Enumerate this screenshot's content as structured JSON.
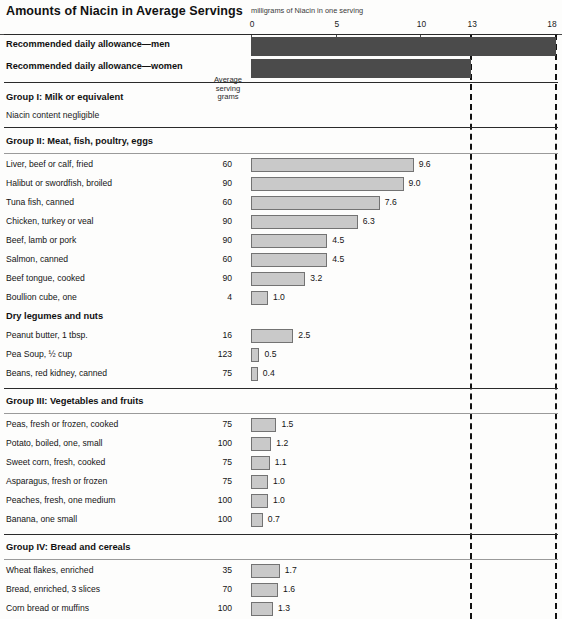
{
  "chart_data": {
    "type": "bar",
    "title": "Amounts of Niacin in Average Servings",
    "xlabel": "milligrams of Niacin in one serving",
    "ylabel": "",
    "xlim": [
      0,
      18
    ],
    "xticks": [
      0,
      5,
      10,
      13,
      18
    ],
    "xtick_labels": [
      "0",
      "5",
      "10",
      "13",
      "18"
    ],
    "grid": false,
    "legend": "none",
    "orientation": "horizontal",
    "reference_lines": [
      {
        "value": 13,
        "style": "dashed",
        "label": "Recommended daily allowance—women"
      },
      {
        "value": 18,
        "style": "dashed",
        "label": "Recommended daily allowance—men"
      }
    ],
    "series": [
      {
        "name": "Recommended daily allowance",
        "color": "#4b4b4b",
        "items": [
          {
            "label": "Recommended daily allowance—men",
            "value": 18
          },
          {
            "label": "Recommended daily allowance—women",
            "value": 13
          }
        ]
      },
      {
        "name": "Niacin content of servings",
        "color": "#c9c9c9",
        "items": [
          {
            "label": "Liver, beef or calf, fried",
            "grams": "60",
            "value": 9.6,
            "value_label": "9.6"
          },
          {
            "label": "Halibut or swordfish, broiled",
            "grams": "90",
            "value": 9.0,
            "value_label": "9.0"
          },
          {
            "label": "Tuna fish, canned",
            "grams": "60",
            "value": 7.6,
            "value_label": "7.6"
          },
          {
            "label": "Chicken, turkey or veal",
            "grams": "90",
            "value": 6.3,
            "value_label": "6.3"
          },
          {
            "label": "Beef, lamb or pork",
            "grams": "90",
            "value": 4.5,
            "value_label": "4.5"
          },
          {
            "label": "Salmon, canned",
            "grams": "60",
            "value": 4.5,
            "value_label": "4.5"
          },
          {
            "label": "Beef tongue, cooked",
            "grams": "90",
            "value": 3.2,
            "value_label": "3.2"
          },
          {
            "label": "Boullion cube, one",
            "grams": "4",
            "value": 1.0,
            "value_label": "1.0"
          },
          {
            "label": "Peanut butter, 1 tbsp.",
            "grams": "16",
            "value": 2.5,
            "value_label": "2.5"
          },
          {
            "label": "Pea Soup, ½ cup",
            "grams": "123",
            "value": 0.5,
            "value_label": "0.5"
          },
          {
            "label": "Beans, red kidney, canned",
            "grams": "75",
            "value": 0.4,
            "value_label": "0.4"
          },
          {
            "label": "Peas, fresh or frozen, cooked",
            "grams": "75",
            "value": 1.5,
            "value_label": "1.5"
          },
          {
            "label": "Potato, boiled, one, small",
            "grams": "100",
            "value": 1.2,
            "value_label": "1.2"
          },
          {
            "label": "Sweet corn, fresh, cooked",
            "grams": "75",
            "value": 1.1,
            "value_label": "1.1"
          },
          {
            "label": "Asparagus, fresh or frozen",
            "grams": "75",
            "value": 1.0,
            "value_label": "1.0"
          },
          {
            "label": "Peaches, fresh, one medium",
            "grams": "100",
            "value": 1.0,
            "value_label": "1.0"
          },
          {
            "label": "Banana, one small",
            "grams": "100",
            "value": 0.7,
            "value_label": "0.7"
          },
          {
            "label": "Wheat flakes, enriched",
            "grams": "35",
            "value": 1.7,
            "value_label": "1.7"
          },
          {
            "label": "Bread, enriched, 3 slices",
            "grams": "70",
            "value": 1.6,
            "value_label": "1.6"
          },
          {
            "label": "Corn bread or muffins",
            "grams": "100",
            "value": 1.3,
            "value_label": "1.3"
          },
          {
            "label": "Rice, converted, cooked",
            "grams": "100",
            "value": 1.2,
            "value_label": "1.2"
          }
        ]
      }
    ]
  },
  "header": {
    "title": "Amounts of Niacin in Average Servings",
    "axis_caption": "milligrams of Niacin in one serving"
  },
  "axis": {
    "ticks": [
      {
        "label": "0",
        "value": 0
      },
      {
        "label": "5",
        "value": 5
      },
      {
        "label": "10",
        "value": 10
      },
      {
        "label": "13",
        "value": 13
      },
      {
        "label": "18",
        "value": 18
      }
    ]
  },
  "column_header": {
    "line1": "Average",
    "line2": "serving",
    "line3": "grams"
  },
  "rda": [
    {
      "label": "Recommended daily allowance—men",
      "value": 18
    },
    {
      "label": "Recommended daily allowance—women",
      "value": 13
    }
  ],
  "groups": [
    {
      "heading": "Group I: Milk or equivalent",
      "note": "Niacin content negligible",
      "rows": []
    },
    {
      "heading": "Group II: Meat, fish, poultry, eggs",
      "rows": [
        {
          "label": "Liver, beef or calf, fried",
          "grams": "60",
          "value": 9.6,
          "value_label": "9.6"
        },
        {
          "label": "Halibut or swordfish, broiled",
          "grams": "90",
          "value": 9.0,
          "value_label": "9.0"
        },
        {
          "label": "Tuna fish, canned",
          "grams": "60",
          "value": 7.6,
          "value_label": "7.6"
        },
        {
          "label": "Chicken, turkey or veal",
          "grams": "90",
          "value": 6.3,
          "value_label": "6.3"
        },
        {
          "label": "Beef, lamb or pork",
          "grams": "90",
          "value": 4.5,
          "value_label": "4.5"
        },
        {
          "label": "Salmon, canned",
          "grams": "60",
          "value": 4.5,
          "value_label": "4.5"
        },
        {
          "label": "Beef tongue, cooked",
          "grams": "90",
          "value": 3.2,
          "value_label": "3.2"
        },
        {
          "label": "Boullion cube, one",
          "grams": "4",
          "value": 1.0,
          "value_label": "1.0"
        }
      ],
      "subheading": "Dry legumes and nuts",
      "subrows": [
        {
          "label": "Peanut butter, 1 tbsp.",
          "grams": "16",
          "value": 2.5,
          "value_label": "2.5"
        },
        {
          "label": "Pea Soup, ½ cup",
          "grams": "123",
          "value": 0.5,
          "value_label": "0.5"
        },
        {
          "label": "Beans, red kidney, canned",
          "grams": "75",
          "value": 0.4,
          "value_label": "0.4"
        }
      ]
    },
    {
      "heading": "Group III: Vegetables and fruits",
      "rows": [
        {
          "label": "Peas, fresh or frozen, cooked",
          "grams": "75",
          "value": 1.5,
          "value_label": "1.5"
        },
        {
          "label": "Potato, boiled, one, small",
          "grams": "100",
          "value": 1.2,
          "value_label": "1.2"
        },
        {
          "label": "Sweet corn, fresh, cooked",
          "grams": "75",
          "value": 1.1,
          "value_label": "1.1"
        },
        {
          "label": "Asparagus, fresh or frozen",
          "grams": "75",
          "value": 1.0,
          "value_label": "1.0"
        },
        {
          "label": "Peaches, fresh, one medium",
          "grams": "100",
          "value": 1.0,
          "value_label": "1.0"
        },
        {
          "label": "Banana, one small",
          "grams": "100",
          "value": 0.7,
          "value_label": "0.7"
        }
      ]
    },
    {
      "heading": "Group IV: Bread and cereals",
      "rows": [
        {
          "label": "Wheat flakes, enriched",
          "grams": "35",
          "value": 1.7,
          "value_label": "1.7"
        },
        {
          "label": "Bread, enriched, 3 slices",
          "grams": "70",
          "value": 1.6,
          "value_label": "1.6"
        },
        {
          "label": "Corn bread or muffins",
          "grams": "100",
          "value": 1.3,
          "value_label": "1.3"
        },
        {
          "label": "Rice, converted, cooked",
          "grams": "100",
          "value": 1.2,
          "value_label": "1.2"
        }
      ]
    }
  ],
  "colors": {
    "bar_fill": "#c9c9c9",
    "bar_stroke": "#737373",
    "rda_fill": "#4b4b4b",
    "rule": "#2a2a2a",
    "background": "#fdfdfc"
  }
}
